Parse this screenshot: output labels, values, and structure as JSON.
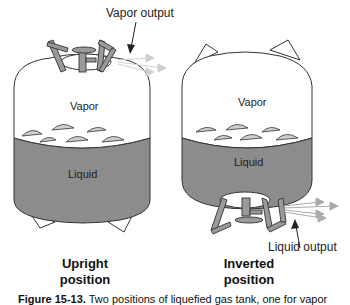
{
  "figure": {
    "upright": {
      "callout": "Vapor output",
      "vapor_label": "Vapor",
      "liquid_label": "Liquid",
      "caption_line1": "Upright",
      "caption_line2": "position"
    },
    "inverted": {
      "callout": "Liquid output",
      "vapor_label": "Vapor",
      "liquid_label": "Liquid",
      "caption_line1": "Inverted",
      "caption_line2": "position"
    },
    "caption": {
      "number": "Figure 15-13.",
      "text": "Two positions of liquefied gas tank, one for vapor"
    },
    "colors": {
      "liquid": "#8c8c8c",
      "valve": "#9a9a9a",
      "bubble": "#cfcfcf",
      "outline": "#333333"
    }
  }
}
